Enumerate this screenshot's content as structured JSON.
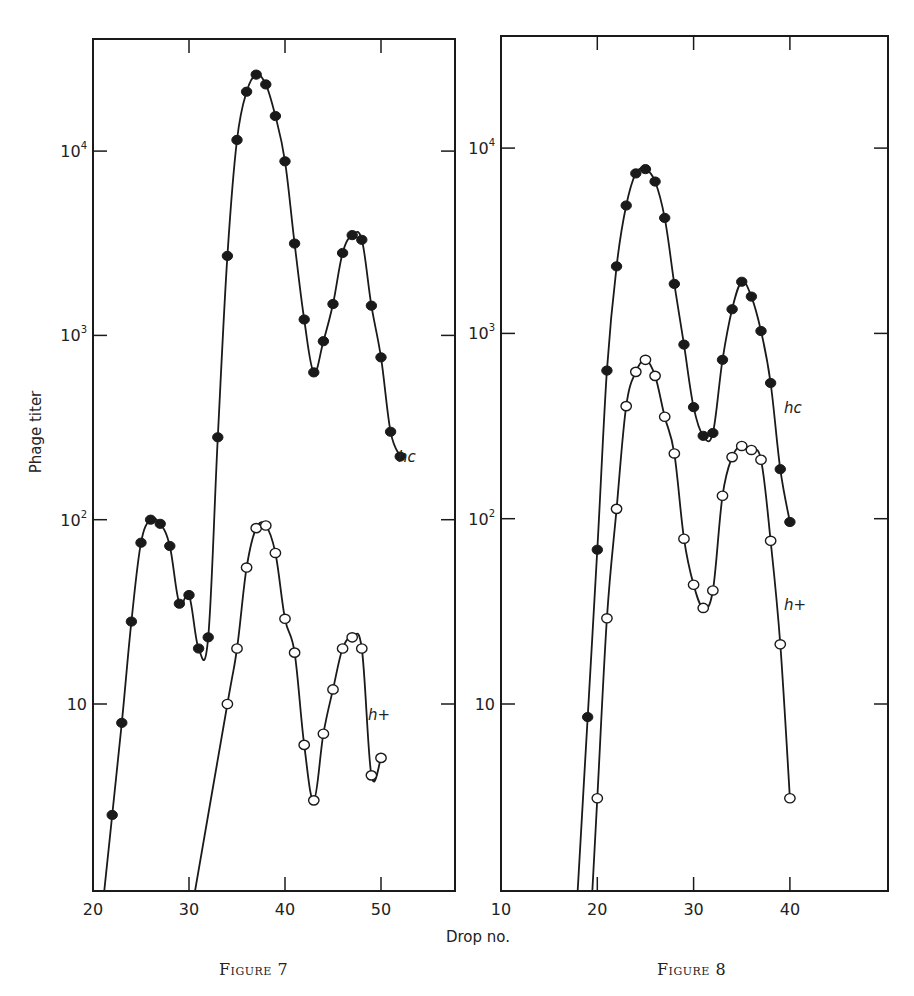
{
  "chart_data": [
    {
      "type": "line",
      "title": "Figure 7",
      "caption": "Figure 7",
      "xlabel": "Drop no.",
      "ylabel": "Phage titer",
      "yscale": "log",
      "xlim": [
        20,
        58
      ],
      "ylim": [
        1,
        50000
      ],
      "x_ticks": [
        20,
        30,
        40,
        50
      ],
      "y_ticks": [
        {
          "value": 10,
          "label": "10"
        },
        {
          "value": 100,
          "label": "10",
          "sup": "2"
        },
        {
          "value": 1000,
          "label": "10",
          "sup": "3"
        },
        {
          "value": 10000,
          "label": "10",
          "sup": "4"
        }
      ],
      "grid": false,
      "series": [
        {
          "name": "hc",
          "marker": "filled-circle",
          "x": [
            22,
            23,
            24,
            25,
            26,
            27,
            28,
            29,
            30,
            31,
            32,
            33,
            34,
            35,
            36,
            37,
            38,
            39,
            40,
            41,
            42,
            43,
            44,
            45,
            46,
            47,
            48,
            49,
            50,
            51,
            52
          ],
          "values": [
            2.5,
            7.9,
            28,
            75,
            100,
            95,
            72,
            35,
            39,
            20,
            23,
            280,
            2700,
            11500,
            21000,
            26000,
            23000,
            15500,
            8800,
            3150,
            1220,
            630,
            930,
            1480,
            2800,
            3500,
            3300,
            1450,
            760,
            300,
            220
          ]
        },
        {
          "name": "h+",
          "marker": "open-circle",
          "x": [
            34,
            35,
            36,
            37,
            38,
            39,
            40,
            41,
            42,
            43,
            44,
            45,
            46,
            47,
            48,
            49,
            50
          ],
          "values": [
            10,
            20,
            55,
            90,
            93,
            66,
            29,
            19,
            6,
            3.0,
            6.9,
            12,
            20,
            23,
            20,
            4.1,
            5.1
          ]
        }
      ]
    },
    {
      "type": "line",
      "title": "Figure 8",
      "caption": "Figure 8",
      "xlabel": "Drop no.",
      "ylabel": "Phage titer",
      "yscale": "log",
      "xlim": [
        10,
        50
      ],
      "ylim": [
        1,
        50000
      ],
      "x_ticks": [
        10,
        20,
        30,
        40
      ],
      "y_ticks": [
        {
          "value": 10,
          "label": "10"
        },
        {
          "value": 100,
          "label": "10",
          "sup": "2"
        },
        {
          "value": 1000,
          "label": "10",
          "sup": "3"
        },
        {
          "value": 10000,
          "label": "10",
          "sup": "4"
        }
      ],
      "grid": false,
      "series": [
        {
          "name": "hc",
          "marker": "filled-circle",
          "x": [
            19,
            20,
            21,
            22,
            23,
            24,
            25,
            26,
            27,
            28,
            29,
            30,
            31,
            32,
            33,
            34,
            35,
            36,
            37,
            38,
            39,
            40
          ],
          "values": [
            8.5,
            68,
            630,
            2300,
            4900,
            7300,
            7700,
            6600,
            4200,
            1850,
            870,
            400,
            280,
            290,
            720,
            1350,
            1900,
            1580,
            1030,
            540,
            185,
            96
          ]
        },
        {
          "name": "h+",
          "marker": "open-circle",
          "x": [
            20,
            21,
            22,
            23,
            24,
            25,
            26,
            27,
            28,
            29,
            30,
            31,
            32,
            33,
            34,
            35,
            36,
            37,
            38,
            39,
            40
          ],
          "values": [
            3.1,
            29,
            113,
            405,
            620,
            720,
            590,
            355,
            225,
            78,
            44,
            33,
            41,
            133,
            215,
            247,
            235,
            208,
            76,
            21,
            3.1
          ]
        }
      ]
    }
  ],
  "labels": {
    "ylabel": "Phage titer",
    "xlabel": "Drop no.",
    "figure7_caption": "Figure 7",
    "figure8_caption": "Figure 8",
    "fig7_hc": "hc",
    "fig7_hplus": "h+",
    "fig8_hc": "hc",
    "fig8_hplus": "h+"
  }
}
